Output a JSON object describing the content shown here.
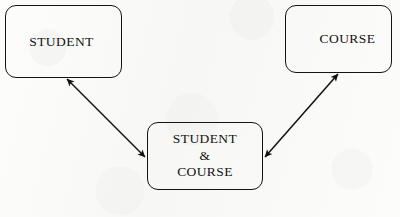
{
  "diagram": {
    "type": "entity-relationship-diagram",
    "background_color": "#fbfbfa",
    "stroke_color": "#141414",
    "text_color": "#111111",
    "entities": [
      {
        "id": "student",
        "label": "STUDENT",
        "shape": "rounded-rectangle",
        "x": 5,
        "y": 5,
        "width": 117,
        "height": 73
      },
      {
        "id": "course",
        "label": "COURSE",
        "shape": "rounded-rectangle",
        "x": 285,
        "y": 5,
        "width": 107,
        "height": 68
      },
      {
        "id": "student-course",
        "label": "STUDENT\n&\nCOURSE",
        "shape": "rounded-rectangle",
        "x": 147,
        "y": 122,
        "width": 116,
        "height": 68
      }
    ],
    "connectors": [
      {
        "id": "student-to-student-course",
        "from": "student",
        "to": "student-course",
        "style": "double-headed-arrow",
        "x1": 67,
        "y1": 79,
        "x2": 145,
        "y2": 157
      },
      {
        "id": "course-to-student-course",
        "from": "student-course",
        "to": "course",
        "style": "double-headed-arrow",
        "x1": 265,
        "y1": 157,
        "x2": 338,
        "y2": 74
      }
    ]
  }
}
